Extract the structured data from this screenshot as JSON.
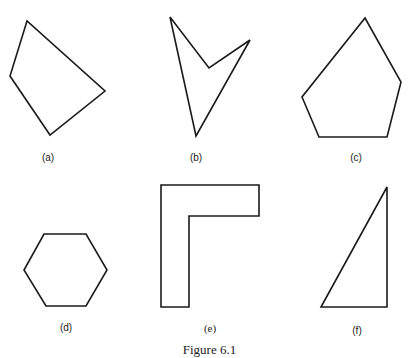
{
  "figure": {
    "caption": "Figure 6.1",
    "stroke_color": "#1a1a1a",
    "background_color": "#ffffff",
    "shapes": [
      {
        "id": "a",
        "label": "(a)",
        "kind": "convex quadrilateral",
        "points": "27,21 10,76 50,135 105,91",
        "label_pos": [
          48,
          152
        ]
      },
      {
        "id": "b",
        "label": "(b)",
        "kind": "concave quadrilateral (arrowhead)",
        "points": "170,17 209,68 250,40 196,136",
        "label_pos": [
          196,
          152
        ]
      },
      {
        "id": "c",
        "label": "(c)",
        "kind": "convex pentagon",
        "points": "365,18 401,82 387,137 319,137 302,97",
        "label_pos": [
          356,
          152
        ]
      },
      {
        "id": "d",
        "label": "(d)",
        "kind": "regular hexagon",
        "points": "44,234 86,234 107,270 86,306 46,306 24,270",
        "label_pos": [
          66,
          322
        ]
      },
      {
        "id": "e",
        "label": "(e)",
        "kind": "L-shaped hexagon",
        "points": "161,185 259,185 259,216 189,216 189,307 161,307",
        "label_pos": [
          210,
          323
        ]
      },
      {
        "id": "f",
        "label": "(f)",
        "kind": "right triangle",
        "points": "387,187 387,307 321,307",
        "label_pos": [
          357,
          325
        ]
      }
    ]
  }
}
